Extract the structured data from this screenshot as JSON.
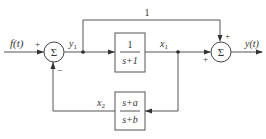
{
  "diagram": {
    "type": "block-diagram",
    "input": {
      "label": "f(t)"
    },
    "output": {
      "label": "y(t)"
    },
    "summers": [
      {
        "id": "sum1",
        "symbol": "Σ",
        "inputs": [
          {
            "from": "f(t)",
            "sign": "+"
          },
          {
            "from": "x2",
            "sign": "−"
          }
        ],
        "output": "y1"
      },
      {
        "id": "sum2",
        "symbol": "Σ",
        "inputs": [
          {
            "from": "gain_1",
            "sign": "+"
          },
          {
            "from": "x1",
            "sign": "+"
          }
        ],
        "output": "y(t)"
      }
    ],
    "blocks": [
      {
        "id": "forward",
        "numerator": "1",
        "denominator": "s+1",
        "input": "y1",
        "output": "x1"
      },
      {
        "id": "feedback",
        "numerator": "s+a",
        "denominator": "s+b",
        "input": "x1",
        "output": "x2"
      }
    ],
    "feedforward": {
      "gain_label": "1",
      "from": "y1",
      "to": "sum2"
    },
    "signals": {
      "y1": "y",
      "y1_sub": "1",
      "x1": "x",
      "x1_sub": "1",
      "x2": "x",
      "x2_sub": "2"
    },
    "signs": {
      "sum1_in": "+",
      "sum1_fb": "−",
      "sum2_top": "+",
      "sum2_left": "+"
    },
    "sum_symbol": "Σ",
    "colors": {
      "line": "#555555",
      "text": "#333333"
    }
  }
}
